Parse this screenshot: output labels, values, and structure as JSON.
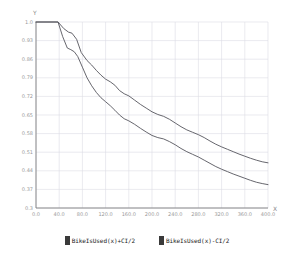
{
  "axes": {
    "y_letter": "Y",
    "x_letter": "X",
    "y_ticks": [
      "1.0",
      "0.93",
      "0.86",
      "0.79",
      "0.72",
      "0.65",
      "0.58",
      "0.51",
      "0.44",
      "0.37",
      "0.3"
    ],
    "x_ticks": [
      "0.0",
      "40.0",
      "80.0",
      "120.0",
      "160.0",
      "200.0",
      "240.0",
      "280.0",
      "320.0",
      "360.0",
      "400.0"
    ]
  },
  "legend": {
    "entries": [
      {
        "label": "BikeIsUsed(x)+CI/2",
        "color": "#3a3a3a"
      },
      {
        "label": "BikeIsUsed(x)-CI/2",
        "color": "#3a3a3a"
      }
    ]
  },
  "style": {
    "grid_color": "#dcdce4",
    "axis_color": "#808080",
    "line_color": "#55555c",
    "plot_bg": "#ffffff"
  },
  "chart_data": {
    "type": "line",
    "title": "",
    "xlabel": "X",
    "ylabel": "Y",
    "xlim": [
      0,
      400
    ],
    "ylim": [
      0.3,
      1.0
    ],
    "grid": true,
    "legend_position": "bottom",
    "series": [
      {
        "name": "BikeIsUsed(x)+CI/2",
        "points": [
          [
            0,
            1.0
          ],
          [
            38,
            1.0
          ],
          [
            48,
            0.975
          ],
          [
            56,
            0.962
          ],
          [
            62,
            0.958
          ],
          [
            70,
            0.935
          ],
          [
            78,
            0.885
          ],
          [
            88,
            0.855
          ],
          [
            96,
            0.838
          ],
          [
            104,
            0.818
          ],
          [
            112,
            0.8
          ],
          [
            120,
            0.785
          ],
          [
            128,
            0.775
          ],
          [
            136,
            0.762
          ],
          [
            144,
            0.742
          ],
          [
            152,
            0.73
          ],
          [
            160,
            0.722
          ],
          [
            170,
            0.706
          ],
          [
            180,
            0.69
          ],
          [
            190,
            0.676
          ],
          [
            200,
            0.662
          ],
          [
            210,
            0.652
          ],
          [
            220,
            0.645
          ],
          [
            230,
            0.634
          ],
          [
            240,
            0.62
          ],
          [
            250,
            0.606
          ],
          [
            260,
            0.594
          ],
          [
            270,
            0.585
          ],
          [
            280,
            0.576
          ],
          [
            290,
            0.565
          ],
          [
            300,
            0.552
          ],
          [
            310,
            0.54
          ],
          [
            320,
            0.53
          ],
          [
            330,
            0.521
          ],
          [
            340,
            0.512
          ],
          [
            350,
            0.503
          ],
          [
            360,
            0.495
          ],
          [
            370,
            0.487
          ],
          [
            380,
            0.48
          ],
          [
            390,
            0.474
          ],
          [
            400,
            0.47
          ]
        ]
      },
      {
        "name": "BikeIsUsed(x)-CI/2",
        "points": [
          [
            0,
            1.0
          ],
          [
            38,
            1.0
          ],
          [
            46,
            0.945
          ],
          [
            54,
            0.902
          ],
          [
            60,
            0.896
          ],
          [
            66,
            0.888
          ],
          [
            72,
            0.87
          ],
          [
            80,
            0.83
          ],
          [
            88,
            0.79
          ],
          [
            96,
            0.76
          ],
          [
            104,
            0.735
          ],
          [
            112,
            0.715
          ],
          [
            120,
            0.7
          ],
          [
            128,
            0.685
          ],
          [
            136,
            0.668
          ],
          [
            144,
            0.65
          ],
          [
            152,
            0.636
          ],
          [
            160,
            0.628
          ],
          [
            170,
            0.615
          ],
          [
            180,
            0.6
          ],
          [
            190,
            0.586
          ],
          [
            200,
            0.573
          ],
          [
            210,
            0.565
          ],
          [
            220,
            0.56
          ],
          [
            230,
            0.55
          ],
          [
            240,
            0.538
          ],
          [
            250,
            0.524
          ],
          [
            260,
            0.512
          ],
          [
            270,
            0.502
          ],
          [
            280,
            0.492
          ],
          [
            290,
            0.48
          ],
          [
            300,
            0.468
          ],
          [
            310,
            0.456
          ],
          [
            320,
            0.446
          ],
          [
            330,
            0.437
          ],
          [
            340,
            0.428
          ],
          [
            350,
            0.42
          ],
          [
            360,
            0.412
          ],
          [
            370,
            0.404
          ],
          [
            380,
            0.397
          ],
          [
            390,
            0.392
          ],
          [
            400,
            0.388
          ]
        ]
      }
    ]
  }
}
